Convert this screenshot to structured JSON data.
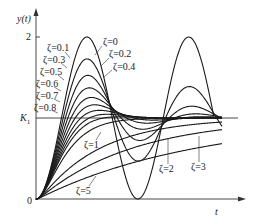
{
  "chart_data": {
    "type": "line",
    "title": "",
    "xlabel": "t",
    "ylabel": "y(t)",
    "y_ticks": [
      {
        "label": "0",
        "value": 0
      },
      {
        "label": "K1",
        "value": 1
      },
      {
        "label": "2",
        "value": 2
      }
    ],
    "reference_line": {
      "label": "K1",
      "value": 1
    },
    "grid": false,
    "legend": "inline labels",
    "x_range_periods": 1.85,
    "ylim": [
      0,
      2.15
    ],
    "series": [
      {
        "name": "ζ=0",
        "zeta": 0
      },
      {
        "name": "ζ=0.1",
        "zeta": 0.1
      },
      {
        "name": "ζ=0.2",
        "zeta": 0.2
      },
      {
        "name": "ζ=0.3",
        "zeta": 0.3
      },
      {
        "name": "ζ=0.4",
        "zeta": 0.4
      },
      {
        "name": "ζ=0.5",
        "zeta": 0.5
      },
      {
        "name": "ζ=0.6",
        "zeta": 0.6
      },
      {
        "name": "ζ=0.7",
        "zeta": 0.7
      },
      {
        "name": "ζ=0.8",
        "zeta": 0.8
      },
      {
        "name": "ζ=1",
        "zeta": 1
      },
      {
        "name": "ζ=2",
        "zeta": 2
      },
      {
        "name": "ζ=3",
        "zeta": 3
      },
      {
        "name": "ζ=5",
        "zeta": 5
      }
    ]
  },
  "axes": {
    "y_label": "y(t)",
    "x_label": "t",
    "origin_label": "0",
    "k_label": "K",
    "k_sub": "1",
    "two_label": "2"
  },
  "labels": {
    "z0": "ζ=0",
    "z01": "ζ=0.1",
    "z02": "ζ=0.2",
    "z03": "ζ=0.3",
    "z04": "ζ=0.4",
    "z05": "ζ=0.5",
    "z06": "ζ=0.6",
    "z07": "ζ=0.7",
    "z08": "ζ=0.8",
    "z1": "ζ=1",
    "z2": "ζ=2",
    "z3": "ζ=3",
    "z5": "ζ=5"
  },
  "plot": {
    "origin_x": 36,
    "origin_y": 199,
    "px_per_unit_y": 81,
    "px_per_rad": 16.2,
    "x_end": 220,
    "curve_end_x": 222,
    "line_color": "#1a1a1a",
    "axis_color": "#333333"
  }
}
